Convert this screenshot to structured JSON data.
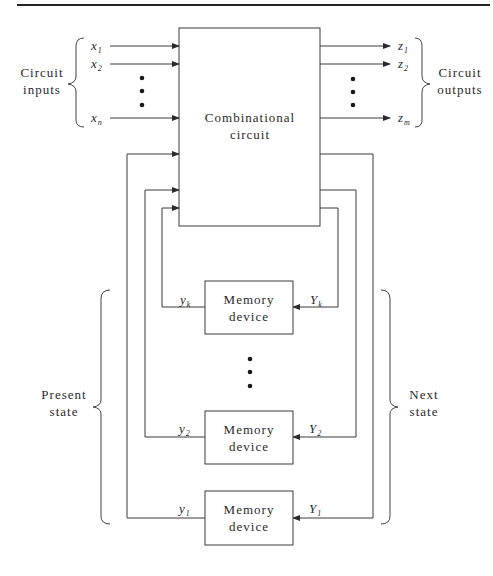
{
  "diagram": {
    "combinational_block": {
      "line1": "Combinational",
      "line2": "circuit"
    },
    "inputs": {
      "group_label_line1": "Circuit",
      "group_label_line2": "inputs",
      "signals": [
        {
          "base": "x",
          "sub": "1"
        },
        {
          "base": "x",
          "sub": "2"
        },
        {
          "base": "x",
          "sub": "n"
        }
      ]
    },
    "outputs": {
      "group_label_line1": "Circuit",
      "group_label_line2": "outputs",
      "signals": [
        {
          "base": "z",
          "sub": "1"
        },
        {
          "base": "z",
          "sub": "2"
        },
        {
          "base": "z",
          "sub": "m"
        }
      ]
    },
    "memory_devices": [
      {
        "line1": "Memory",
        "line2": "device",
        "present": {
          "base": "y",
          "sub": "k"
        },
        "next": {
          "base": "Y",
          "sub": "k"
        }
      },
      {
        "line1": "Memory",
        "line2": "device",
        "present": {
          "base": "y",
          "sub": "2"
        },
        "next": {
          "base": "Y",
          "sub": "2"
        }
      },
      {
        "line1": "Memory",
        "line2": "device",
        "present": {
          "base": "y",
          "sub": "1"
        },
        "next": {
          "base": "Y",
          "sub": "1"
        }
      }
    ],
    "present_state": {
      "line1": "Present",
      "line2": "state"
    },
    "next_state": {
      "line1": "Next",
      "line2": "state"
    }
  }
}
